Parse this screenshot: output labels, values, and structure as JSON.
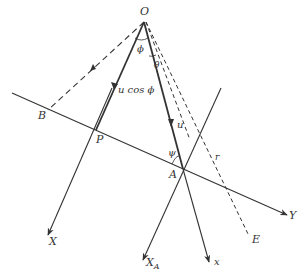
{
  "diagram": {
    "type": "geometry-vector-diagram",
    "colors": {
      "line": "#333333",
      "background": "#ffffff"
    },
    "points": {
      "O": {
        "label": "O",
        "x": 144,
        "y": 22
      },
      "B": {
        "label": "B",
        "x": 48,
        "y": 110
      },
      "P": {
        "label": "P",
        "x": 96,
        "y": 130
      },
      "A": {
        "label": "A",
        "x": 183,
        "y": 169
      },
      "E": {
        "label": "E",
        "x": 249,
        "y": 238
      }
    },
    "axes": {
      "X": {
        "label": "X"
      },
      "X_A": {
        "label": "X",
        "subscript": "A"
      },
      "x": {
        "label": "x"
      },
      "Y": {
        "label": "Y"
      }
    },
    "annotations": {
      "phi": "ϕ",
      "theta": "θ",
      "psi": "ψ",
      "r": "r",
      "u": "u",
      "u_cos_phi": "u cos ϕ"
    }
  }
}
